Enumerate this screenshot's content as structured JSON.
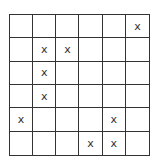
{
  "grid": {
    "rows": 6,
    "cols": 6,
    "mark": "x",
    "cells": [
      [
        "",
        "",
        "",
        "",
        "",
        "x"
      ],
      [
        "",
        "x",
        "x",
        "",
        "",
        ""
      ],
      [
        "",
        "x",
        "",
        "",
        "",
        ""
      ],
      [
        "",
        "x",
        "",
        "",
        "",
        ""
      ],
      [
        "x",
        "",
        "",
        "",
        "x",
        ""
      ],
      [
        "",
        "",
        "",
        "x",
        "x",
        ""
      ]
    ]
  },
  "colors": {
    "line": "#333333",
    "mark": "#333333",
    "background": "#ffffff"
  }
}
